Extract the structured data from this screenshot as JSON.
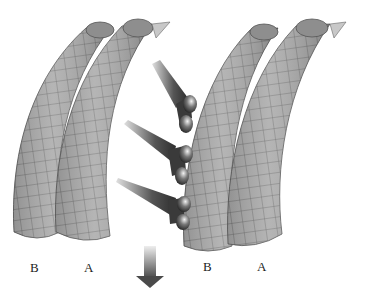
{
  "figure": {
    "labels": {
      "left_b": "B",
      "left_a": "A",
      "right_b": "B",
      "right_a": "A"
    },
    "tubules": [
      {
        "id": "left-B",
        "label": "B"
      },
      {
        "id": "left-A",
        "label": "A"
      },
      {
        "id": "right-B",
        "label": "B"
      },
      {
        "id": "right-A",
        "label": "A"
      }
    ],
    "connectors": {
      "count": 3,
      "heads_per_connector": 2
    },
    "arrow": {
      "direction": "down"
    },
    "colors": {
      "tube_fill": "#a8a8a8",
      "tube_grid": "#5a5a5a",
      "tube_inner": "#8c8c8c",
      "connector_dark": "#3a3a3a",
      "connector_light": "#d8d8d8",
      "arrow_dark": "#555555",
      "arrow_light": "#e6e6e6"
    }
  }
}
